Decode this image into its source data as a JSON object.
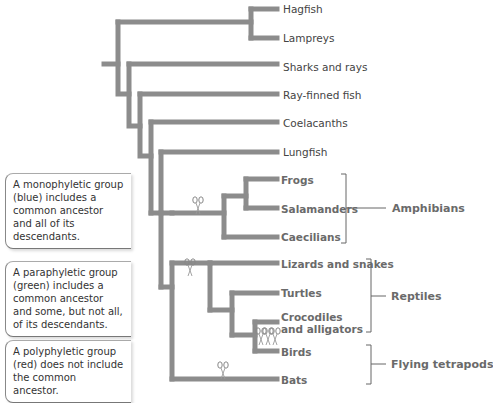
{
  "diagram": {
    "type": "phylogenetic-tree",
    "branch_color": "#8c8c8c",
    "leaves": [
      {
        "name": "Hagfish",
        "bold": false,
        "x": 283,
        "y": 3
      },
      {
        "name": "Lampreys",
        "bold": false,
        "x": 283,
        "y": 32
      },
      {
        "name": "Sharks and rays",
        "bold": false,
        "x": 283,
        "y": 61
      },
      {
        "name": "Ray-finned fish",
        "bold": false,
        "x": 283,
        "y": 89
      },
      {
        "name": "Coelacanths",
        "bold": false,
        "x": 283,
        "y": 117
      },
      {
        "name": "Lungfish",
        "bold": false,
        "x": 283,
        "y": 146
      },
      {
        "name": "Frogs",
        "bold": true,
        "x": 281,
        "y": 174
      },
      {
        "name": "Salamanders",
        "bold": true,
        "x": 281,
        "y": 203
      },
      {
        "name": "Caecilians",
        "bold": true,
        "x": 281,
        "y": 231
      },
      {
        "name": "Lizards and snakes",
        "bold": true,
        "x": 281,
        "y": 258
      },
      {
        "name": "Turtles",
        "bold": true,
        "x": 281,
        "y": 287
      },
      {
        "name": "Crocodiles",
        "bold": true,
        "x": 281,
        "y": 311
      },
      {
        "name": "and alligators",
        "bold": true,
        "x": 281,
        "y": 323
      },
      {
        "name": "Birds",
        "bold": true,
        "x": 281,
        "y": 346
      },
      {
        "name": "Bats",
        "bold": true,
        "x": 281,
        "y": 374
      }
    ],
    "groups": [
      {
        "name": "Amphibians",
        "label_x": 392,
        "label_y": 202,
        "bracket_x": 346,
        "y1": 174,
        "y2": 243,
        "mid": 208,
        "line_x2": 386
      },
      {
        "name": "Reptiles",
        "label_x": 391,
        "label_y": 290,
        "bracket_x": 371,
        "y1": 259,
        "y2": 332,
        "mid": 296,
        "line_x2": 386
      },
      {
        "name": "Flying tetrapods",
        "label_x": 391,
        "label_y": 358,
        "bracket_x": 371,
        "y1": 345,
        "y2": 384,
        "mid": 364,
        "line_x2": 386
      }
    ],
    "branches": [
      "M104 64 H118",
      "M118 22 V94 H129",
      "M118 22 H251",
      "M251 9 V38",
      "M251 9 H277",
      "M251 38 H277",
      "M129 64 V126 H140",
      "M129 64 H277",
      "M140 94 V156 H151",
      "M140 94 H277",
      "M151 122 V213",
      "M151 122 H277",
      "M161 152 V287",
      "M161 152 H277",
      "M151 213 H161",
      "M172 213 V213",
      "M161 213 H224",
      "M224 196 V237",
      "M224 196 H246",
      "M224 237 H277",
      "M246 179 V208",
      "M246 179 H277",
      "M246 208 H277",
      "M161 287 H172",
      "M172 263 V379",
      "M172 379 H277",
      "M172 263 H210",
      "M210 263 V310",
      "M210 263 H277",
      "M210 310 H232",
      "M232 293 V335",
      "M232 293 H277",
      "M232 335 H255",
      "M255 322 V351",
      "M255 322 H277",
      "M255 351 H277"
    ],
    "scissors": [
      {
        "label": "cut-amphibian-stem",
        "x": 198,
        "y": 206
      },
      {
        "label": "cut-reptile-stem",
        "x": 190,
        "y": 268
      },
      {
        "label": "cut-crocodile-1",
        "x": 261,
        "y": 337
      },
      {
        "label": "cut-crocodile-2",
        "x": 268,
        "y": 337
      },
      {
        "label": "cut-crocodile-3",
        "x": 275,
        "y": 337
      },
      {
        "label": "cut-bats",
        "x": 223,
        "y": 371
      }
    ]
  },
  "notes": [
    {
      "text": "A monophyletic group (blue) includes a common ancestor and all of its descendants.",
      "y": 173
    },
    {
      "text": "A paraphyletic group (green) includes a common ancestor and some, but not all, of its descendants.",
      "y": 261
    },
    {
      "text": "A polyphyletic group (red) does not include the common ancestor.",
      "y": 340
    }
  ]
}
